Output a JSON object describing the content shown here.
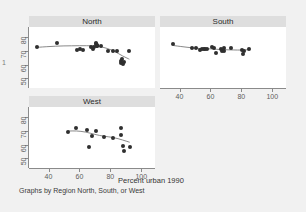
{
  "figure": {
    "edge_marker": "1",
    "x_axis_title": "Percent urban 1990",
    "note": "Graphs by Region North, South, or West"
  },
  "chart_data": {
    "type": "scatter",
    "title": "",
    "subtitle": "",
    "xlabel": "Percent urban 1990",
    "ylabel": "",
    "xlim": [
      30,
      105
    ],
    "ylim": [
      46,
      84
    ],
    "xticks": [
      40,
      60,
      80,
      100
    ],
    "yticks": [
      50,
      60,
      70,
      80
    ],
    "grid": false,
    "legend": "none",
    "annotation": "Graphs by Region North, South, or West",
    "panel_layout": "2x2 small multiples, fourth cell empty",
    "smoother": "lowess",
    "panels": [
      {
        "name": "North",
        "xticks": [
          40,
          60,
          80,
          100
        ],
        "yticks": [
          50,
          60,
          70,
          80
        ],
        "points": [
          {
            "x": 32.8,
            "y": 72.8
          },
          {
            "x": 45.4,
            "y": 75.3
          },
          {
            "x": 58.5,
            "y": 70.5
          },
          {
            "x": 60.6,
            "y": 71.4
          },
          {
            "x": 62.6,
            "y": 70.2
          },
          {
            "x": 67.4,
            "y": 72.7
          },
          {
            "x": 69.1,
            "y": 71.1
          },
          {
            "x": 69.6,
            "y": 72.3
          },
          {
            "x": 70.5,
            "y": 74.5
          },
          {
            "x": 70.8,
            "y": 75.4
          },
          {
            "x": 71.1,
            "y": 73.4
          },
          {
            "x": 71.4,
            "y": 74.1
          },
          {
            "x": 71.7,
            "y": 72.9
          },
          {
            "x": 73.9,
            "y": 73.2
          },
          {
            "x": 78.5,
            "y": 70.0
          },
          {
            "x": 81.8,
            "y": 69.8
          },
          {
            "x": 84.3,
            "y": 69.9
          },
          {
            "x": 86.8,
            "y": 62.3
          },
          {
            "x": 87.1,
            "y": 61.0
          },
          {
            "x": 87.4,
            "y": 63.6
          },
          {
            "x": 88.0,
            "y": 60.4
          },
          {
            "x": 88.6,
            "y": 62.0
          },
          {
            "x": 92.3,
            "y": 69.5
          }
        ],
        "smooth_line": [
          {
            "x": 32.8,
            "y": 72.3
          },
          {
            "x": 45.0,
            "y": 73.2
          },
          {
            "x": 55.0,
            "y": 73.4
          },
          {
            "x": 65.0,
            "y": 73.5
          },
          {
            "x": 72.0,
            "y": 73.2
          },
          {
            "x": 78.0,
            "y": 71.6
          },
          {
            "x": 83.0,
            "y": 69.3
          },
          {
            "x": 88.0,
            "y": 66.0
          },
          {
            "x": 92.3,
            "y": 63.8
          }
        ]
      },
      {
        "name": "South",
        "xticks": [
          40,
          60,
          80,
          100
        ],
        "yticks": [
          50,
          60,
          70,
          80
        ],
        "points": [
          {
            "x": 36.0,
            "y": 74.5
          },
          {
            "x": 48.0,
            "y": 72.0
          },
          {
            "x": 51.0,
            "y": 71.6
          },
          {
            "x": 53.5,
            "y": 70.5
          },
          {
            "x": 54.8,
            "y": 71.1
          },
          {
            "x": 55.6,
            "y": 71.0
          },
          {
            "x": 56.8,
            "y": 71.2
          },
          {
            "x": 57.5,
            "y": 71.0
          },
          {
            "x": 60.8,
            "y": 72.3
          },
          {
            "x": 62.3,
            "y": 71.9
          },
          {
            "x": 63.6,
            "y": 68.2
          },
          {
            "x": 66.8,
            "y": 71.2
          },
          {
            "x": 67.5,
            "y": 69.6
          },
          {
            "x": 68.5,
            "y": 71.5
          },
          {
            "x": 68.9,
            "y": 69.6
          },
          {
            "x": 73.0,
            "y": 72.0
          },
          {
            "x": 80.5,
            "y": 70.2
          },
          {
            "x": 81.0,
            "y": 67.3
          },
          {
            "x": 81.7,
            "y": 69.9
          },
          {
            "x": 85.0,
            "y": 71.3
          }
        ],
        "smooth_line": [
          {
            "x": 36.0,
            "y": 73.6
          },
          {
            "x": 45.0,
            "y": 72.3
          },
          {
            "x": 53.0,
            "y": 71.4
          },
          {
            "x": 60.0,
            "y": 71.2
          },
          {
            "x": 68.0,
            "y": 70.6
          },
          {
            "x": 75.0,
            "y": 70.4
          },
          {
            "x": 80.0,
            "y": 70.3
          },
          {
            "x": 85.0,
            "y": 70.6
          }
        ]
      },
      {
        "name": "West",
        "xticks": [
          40,
          60,
          80,
          100
        ],
        "yticks": [
          50,
          60,
          70,
          80
        ],
        "points": [
          {
            "x": 52.5,
            "y": 68.8
          },
          {
            "x": 57.5,
            "y": 72.0
          },
          {
            "x": 64.8,
            "y": 70.5
          },
          {
            "x": 66.0,
            "y": 57.9
          },
          {
            "x": 68.3,
            "y": 66.0
          },
          {
            "x": 70.8,
            "y": 69.6
          },
          {
            "x": 76.0,
            "y": 65.2
          },
          {
            "x": 82.0,
            "y": 65.0
          },
          {
            "x": 86.6,
            "y": 71.7
          },
          {
            "x": 87.0,
            "y": 67.1
          },
          {
            "x": 88.5,
            "y": 59.0
          },
          {
            "x": 88.8,
            "y": 55.6
          },
          {
            "x": 92.5,
            "y": 58.2
          }
        ],
        "smooth_line": [
          {
            "x": 52.5,
            "y": 69.6
          },
          {
            "x": 58.0,
            "y": 69.8
          },
          {
            "x": 64.0,
            "y": 69.0
          },
          {
            "x": 70.0,
            "y": 67.2
          },
          {
            "x": 76.0,
            "y": 65.8
          },
          {
            "x": 82.0,
            "y": 65.1
          },
          {
            "x": 88.0,
            "y": 63.2
          },
          {
            "x": 92.5,
            "y": 61.6
          }
        ]
      }
    ]
  },
  "panels": {
    "north": {
      "title": "North",
      "yticks": [
        "80",
        "70",
        "60",
        "50"
      ],
      "xticks": []
    },
    "south": {
      "title": "South",
      "yticks": [],
      "xticks": [
        "40",
        "60",
        "80",
        "100"
      ]
    },
    "west": {
      "title": "West",
      "yticks": [
        "80",
        "70",
        "60",
        "50"
      ],
      "xticks": [
        "40",
        "60",
        "80",
        "100"
      ]
    }
  }
}
